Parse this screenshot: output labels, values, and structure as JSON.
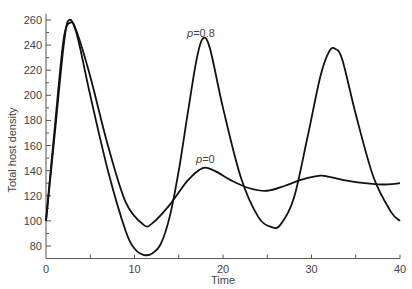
{
  "chart_data": {
    "type": "line",
    "title": "",
    "xlabel": "Time",
    "ylabel": "Total host density",
    "xlim": [
      0,
      40
    ],
    "ylim": [
      70,
      265
    ],
    "x_ticks": [
      0,
      10,
      20,
      30,
      40
    ],
    "y_ticks": [
      80,
      100,
      120,
      140,
      160,
      180,
      200,
      220,
      240,
      260
    ],
    "grid": false,
    "legend": "none (inline curve labels)",
    "series": [
      {
        "name": "p=0.8",
        "label": "p=0.8",
        "x": [
          0,
          1,
          2,
          2.6,
          3.5,
          5,
          7,
          9,
          10,
          11,
          12,
          13,
          14,
          15,
          16,
          17,
          17.7,
          18.5,
          20,
          22,
          24,
          25.5,
          26.5,
          28,
          29.5,
          31,
          32,
          32.7,
          33.5,
          35,
          37,
          39,
          40
        ],
        "values": [
          100,
          170,
          240,
          260,
          248,
          200,
          140,
          92,
          78,
          73,
          74,
          82,
          104,
          140,
          185,
          228,
          245,
          238,
          190,
          135,
          103,
          95,
          97,
          118,
          165,
          215,
          235,
          237,
          228,
          185,
          135,
          107,
          100
        ]
      },
      {
        "name": "p=0",
        "label": "p=0",
        "x": [
          0,
          1,
          2,
          2.8,
          3.5,
          5,
          7,
          9,
          11,
          12,
          14,
          16,
          17.7,
          19,
          21,
          23,
          25,
          27,
          29,
          31,
          32,
          34,
          36,
          38,
          40
        ],
        "values": [
          100,
          175,
          245,
          258,
          250,
          215,
          160,
          115,
          97,
          98,
          113,
          132,
          142,
          140,
          132,
          126,
          124,
          128,
          133,
          136,
          135,
          132,
          130,
          129,
          130
        ]
      }
    ],
    "annotations": [
      {
        "text": "p=0.8",
        "x": 17.3,
        "y": 250
      },
      {
        "text": "p=0",
        "x": 17.3,
        "y": 145
      }
    ]
  },
  "labels": {
    "xlabel": "Time",
    "ylabel": "Total host density",
    "annot_p08_prefix": "p",
    "annot_p08_suffix": "=0.8",
    "annot_p0_prefix": "p",
    "annot_p0_suffix": "=0"
  }
}
